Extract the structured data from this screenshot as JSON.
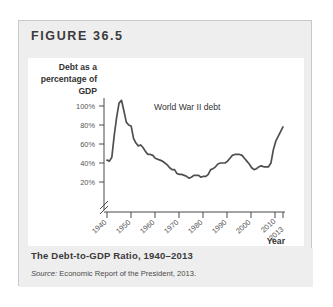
{
  "figure": {
    "label": "FIGURE 36.5",
    "caption": "The Debt-to-GDP Ratio, 1940–2013",
    "source_word": "Source:",
    "source_rest": " Economic Report of the President, 2013."
  },
  "chart_data": {
    "type": "line",
    "title": "The Debt-to-GDP Ratio, 1940–2013",
    "xlabel": "Year",
    "ylabel": "Debt as a percentage of GDP",
    "ylabel_lines": [
      "Debt as a",
      "percentage of",
      "GDP"
    ],
    "ytick_labels": [
      "20%",
      "40%",
      "60%",
      "80%",
      "100%"
    ],
    "ytick_values": [
      20,
      40,
      60,
      80,
      100
    ],
    "xtick_labels": [
      "1940",
      "1950",
      "1960",
      "1970",
      "1980",
      "1990",
      "2000",
      "2010",
      "2013"
    ],
    "xtick_values": [
      1940,
      1950,
      1960,
      1970,
      1980,
      1990,
      2000,
      2010,
      2013
    ],
    "xlim": [
      1940,
      2013
    ],
    "ylim": [
      15,
      110
    ],
    "grid": false,
    "legend": "none",
    "axis_break": true,
    "annotations": [
      {
        "text": "World War II debt",
        "x": 1948,
        "y": 103
      }
    ],
    "series": [
      {
        "name": "Federal debt held by the public as a percentage of GDP",
        "color": "#4f4f4f",
        "x": [
          1940,
          1941,
          1942,
          1943,
          1944,
          1945,
          1946,
          1947,
          1948,
          1949,
          1950,
          1951,
          1952,
          1953,
          1954,
          1955,
          1956,
          1957,
          1958,
          1959,
          1960,
          1961,
          1962,
          1963,
          1964,
          1965,
          1966,
          1967,
          1968,
          1969,
          1970,
          1971,
          1972,
          1973,
          1974,
          1975,
          1976,
          1977,
          1978,
          1979,
          1980,
          1981,
          1982,
          1983,
          1984,
          1985,
          1986,
          1987,
          1988,
          1989,
          1990,
          1991,
          1992,
          1993,
          1994,
          1995,
          1996,
          1997,
          1998,
          1999,
          2000,
          2001,
          2002,
          2003,
          2004,
          2005,
          2006,
          2007,
          2008,
          2009,
          2010,
          2011,
          2012,
          2013
        ],
        "y": [
          43,
          42,
          46,
          69,
          88,
          103,
          106,
          95,
          83,
          80,
          79,
          66,
          61,
          58,
          59,
          56,
          52,
          49,
          49,
          48,
          45,
          44,
          43,
          42,
          40,
          38,
          35,
          33,
          33,
          29,
          28,
          28,
          27,
          26,
          24,
          25,
          27,
          27,
          27,
          25,
          26,
          26,
          28,
          33,
          34,
          36,
          39,
          40,
          40,
          40,
          42,
          45,
          48,
          49,
          49,
          49,
          48,
          45,
          42,
          39,
          35,
          33,
          34,
          36,
          37,
          36,
          36,
          36,
          40,
          54,
          63,
          68,
          73,
          78
        ]
      }
    ]
  }
}
